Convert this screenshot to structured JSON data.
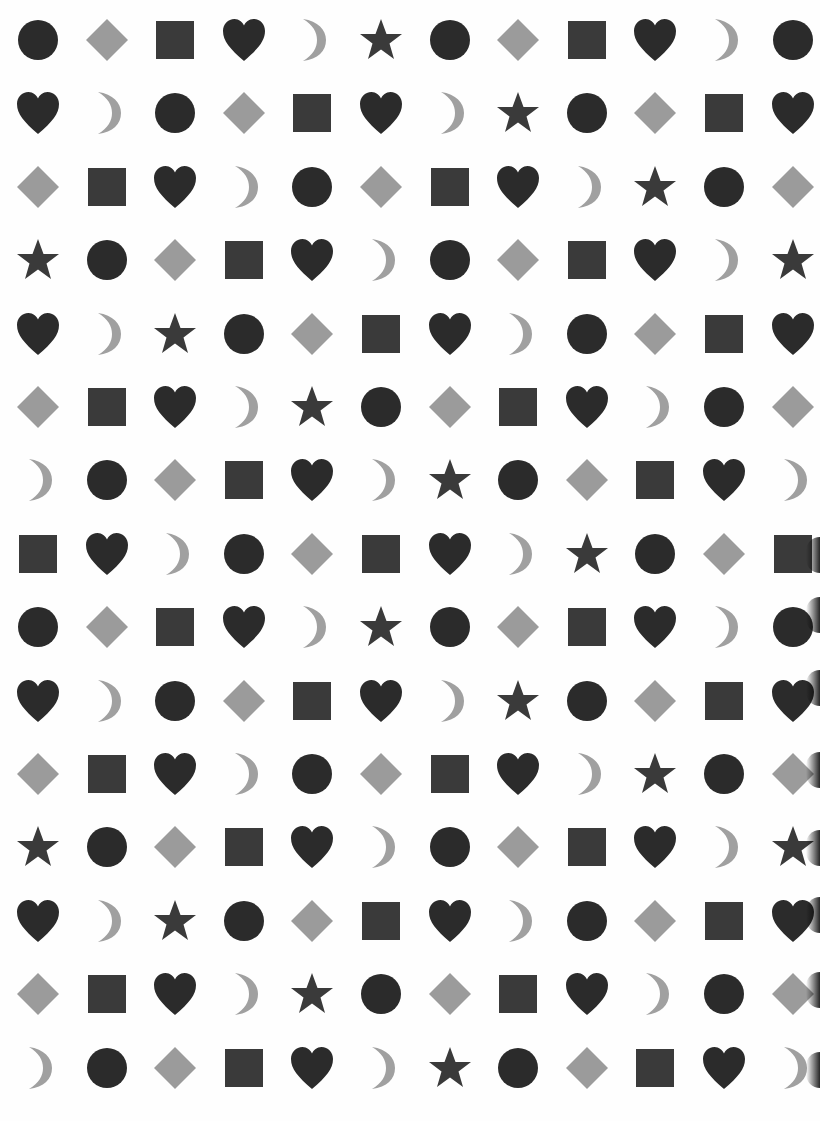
{
  "worksheet": {
    "rows": 15,
    "cols": 12,
    "grid": [
      [
        "circle",
        "diamond",
        "square",
        "heart",
        "moon",
        "star",
        "circle",
        "diamond",
        "square",
        "heart",
        "moon",
        "circle"
      ],
      [
        "heart",
        "moon",
        "circle",
        "diamond",
        "square",
        "heart",
        "moon",
        "star",
        "circle",
        "diamond",
        "square",
        "heart"
      ],
      [
        "diamond",
        "square",
        "heart",
        "moon",
        "circle",
        "diamond",
        "square",
        "heart",
        "moon",
        "star",
        "circle",
        "diamond"
      ],
      [
        "star",
        "circle",
        "diamond",
        "square",
        "heart",
        "moon",
        "circle",
        "diamond",
        "square",
        "heart",
        "moon",
        "star"
      ],
      [
        "heart",
        "moon",
        "star",
        "circle",
        "diamond",
        "square",
        "heart",
        "moon",
        "circle",
        "diamond",
        "square",
        "heart"
      ],
      [
        "diamond",
        "square",
        "heart",
        "moon",
        "star",
        "circle",
        "diamond",
        "square",
        "heart",
        "moon",
        "circle",
        "diamond"
      ],
      [
        "moon",
        "circle",
        "diamond",
        "square",
        "heart",
        "moon",
        "star",
        "circle",
        "diamond",
        "square",
        "heart",
        "moon"
      ],
      [
        "square",
        "heart",
        "moon",
        "circle",
        "diamond",
        "square",
        "heart",
        "moon",
        "star",
        "circle",
        "diamond",
        "square"
      ],
      [
        "circle",
        "diamond",
        "square",
        "heart",
        "moon",
        "star",
        "circle",
        "diamond",
        "square",
        "heart",
        "moon",
        "circle"
      ],
      [
        "heart",
        "moon",
        "circle",
        "diamond",
        "square",
        "heart",
        "moon",
        "star",
        "circle",
        "diamond",
        "square",
        "heart"
      ],
      [
        "diamond",
        "square",
        "heart",
        "moon",
        "circle",
        "diamond",
        "square",
        "heart",
        "moon",
        "star",
        "circle",
        "diamond"
      ],
      [
        "star",
        "circle",
        "diamond",
        "square",
        "heart",
        "moon",
        "circle",
        "diamond",
        "square",
        "heart",
        "moon",
        "star"
      ],
      [
        "heart",
        "moon",
        "star",
        "circle",
        "diamond",
        "square",
        "heart",
        "moon",
        "circle",
        "diamond",
        "square",
        "heart"
      ],
      [
        "diamond",
        "square",
        "heart",
        "moon",
        "star",
        "circle",
        "diamond",
        "square",
        "heart",
        "moon",
        "circle",
        "diamond"
      ],
      [
        "moon",
        "circle",
        "diamond",
        "square",
        "heart",
        "moon",
        "star",
        "circle",
        "diamond",
        "square",
        "heart",
        "moon"
      ]
    ],
    "colors": {
      "circle": "#2b2b2b",
      "heart": "#2b2b2b",
      "square": "#3a3a3a",
      "star": "#3a3a3a",
      "diamond": "#9b9b9b",
      "moon": "#a0a0a0",
      "background": "#fefefe"
    },
    "layout": {
      "col_start_x": 38,
      "col_step": 68.6,
      "row_start_y": 40,
      "row_step": 73.4
    },
    "edge_shadows_y": [
      555,
      615,
      688,
      770,
      848,
      915,
      990,
      1070
    ]
  }
}
